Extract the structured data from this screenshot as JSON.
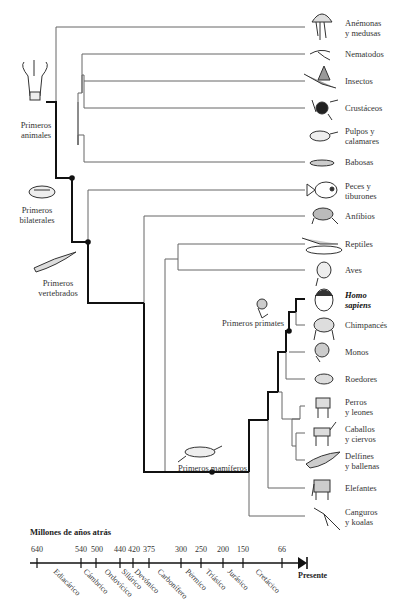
{
  "leaves": [
    {
      "line1": "Anémonas",
      "line2": "y medusas",
      "icon": "jellyfish-icon"
    },
    {
      "line1": "Nematodos",
      "line2": "",
      "icon": "nematode-icon"
    },
    {
      "line1": "Insectos",
      "line2": "",
      "icon": "insect-icon"
    },
    {
      "line1": "Crustáceos",
      "line2": "",
      "icon": "crab-icon"
    },
    {
      "line1": "Pulpos y",
      "line2": "calamares",
      "icon": "squid-icon"
    },
    {
      "line1": "Babosas",
      "line2": "",
      "icon": "slug-icon"
    },
    {
      "line1": "Peces y",
      "line2": "tiburones",
      "icon": "fish-icon"
    },
    {
      "line1": "Anfibios",
      "line2": "",
      "icon": "frog-icon"
    },
    {
      "line1": "Reptiles",
      "line2": "",
      "icon": "reptile-icon"
    },
    {
      "line1": "Aves",
      "line2": "",
      "icon": "bird-icon"
    },
    {
      "line1": "Homo",
      "line2": "sapiens",
      "icon": "human-icon"
    },
    {
      "line1": "Chimpancés",
      "line2": "",
      "icon": "chimpanzee-icon"
    },
    {
      "line1": "Monos",
      "line2": "",
      "icon": "monkey-icon"
    },
    {
      "line1": "Roedores",
      "line2": "",
      "icon": "rodent-icon"
    },
    {
      "line1": "Perros",
      "line2": "y leones",
      "icon": "dog-icon"
    },
    {
      "line1": "Caballos",
      "line2": "y ciervos",
      "icon": "horse-icon"
    },
    {
      "line1": "Delfines",
      "line2": "y ballenas",
      "icon": "whale-icon"
    },
    {
      "line1": "Elefantes",
      "line2": "",
      "icon": "elephant-icon"
    },
    {
      "line1": "Canguros",
      "line2": "y koalas",
      "icon": "kangaroo-icon"
    }
  ],
  "milestones": {
    "first_animals": {
      "line1": "Primeros",
      "line2": "animales"
    },
    "first_bilaterals": {
      "line1": "Primeros",
      "line2": "bilaterales"
    },
    "first_vertebrates": {
      "line1": "Primeros",
      "line2": "vertebrados"
    },
    "first_primates": {
      "line1": "Primeros primates"
    },
    "first_mammals": {
      "line1": "Primeros mamíferos"
    }
  },
  "timeline": {
    "title": "Millones de años atrás",
    "ticks": [
      "640",
      "540",
      "500",
      "440",
      "420",
      "375",
      "300",
      "250",
      "200",
      "150",
      "66"
    ],
    "periods": [
      "Ediacárico",
      "Cámbrico",
      "Ordovícico",
      "Silúrico",
      "Devónico",
      "Carbonífero",
      "Pérmico",
      "Triásico",
      "Jurásico",
      "Cretácico"
    ],
    "end_label": "Presente"
  },
  "colors": {
    "line": "#555555",
    "main_lineage": "#111111",
    "node": "#111111"
  }
}
